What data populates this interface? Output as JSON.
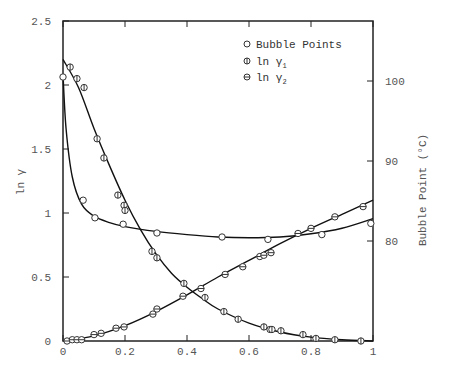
{
  "chart_data": {
    "type": "scatter",
    "title": "",
    "xlabel": "",
    "ylabel": "ln γ",
    "y2label": "Bubble Point (°C)",
    "xlim": [
      0,
      1
    ],
    "ylim": [
      0,
      2.5
    ],
    "y2lim": [
      67.5,
      107.5
    ],
    "grid": false,
    "legend_position": "upper right (inside)",
    "x_ticks": [
      "0",
      "0.2",
      "0.4",
      "0.6",
      "0.8",
      "1"
    ],
    "y_ticks": [
      "0",
      "0.5",
      "1",
      "1.5",
      "2",
      "2.5"
    ],
    "y2_ticks": [
      "80",
      "90",
      "100"
    ],
    "legend": [
      {
        "marker": "open-circle",
        "label": "Bubble Points"
      },
      {
        "marker": "circle-vertical-bar",
        "label": "ln γ₁"
      },
      {
        "marker": "circle-horizontal-bar",
        "label": "ln γ₂"
      }
    ],
    "series": [
      {
        "name": "Bubble Points",
        "axis": "right",
        "marker": "open-circle",
        "x": [
          0.0,
          0.065,
          0.103,
          0.194,
          0.303,
          0.513,
          0.661,
          0.835,
          0.993
        ],
        "y": [
          100.5,
          85.1,
          82.9,
          82.1,
          81.0,
          80.5,
          80.2,
          80.8,
          82.2
        ]
      },
      {
        "name": "ln γ₁",
        "axis": "left",
        "marker": "circle-vertical-bar",
        "x": [
          0.023,
          0.045,
          0.068,
          0.11,
          0.132,
          0.177,
          0.197,
          0.2,
          0.287,
          0.303,
          0.39,
          0.458,
          0.519,
          0.565,
          0.648,
          0.668,
          0.674,
          0.703,
          0.774,
          0.816,
          0.877,
          0.961
        ],
        "y": [
          2.14,
          2.05,
          1.98,
          1.58,
          1.43,
          1.14,
          1.06,
          1.02,
          0.7,
          0.65,
          0.45,
          0.34,
          0.23,
          0.17,
          0.11,
          0.09,
          0.09,
          0.08,
          0.05,
          0.02,
          0.01,
          0.0
        ]
      },
      {
        "name": "ln γ₂",
        "axis": "left",
        "marker": "circle-horizontal-bar",
        "x": [
          0.013,
          0.03,
          0.045,
          0.06,
          0.1,
          0.123,
          0.171,
          0.197,
          0.29,
          0.303,
          0.387,
          0.445,
          0.523,
          0.58,
          0.635,
          0.648,
          0.671,
          0.758,
          0.8,
          0.877,
          0.968
        ],
        "y": [
          0.0,
          0.01,
          0.01,
          0.01,
          0.05,
          0.06,
          0.1,
          0.11,
          0.21,
          0.25,
          0.35,
          0.41,
          0.52,
          0.58,
          0.66,
          0.67,
          0.69,
          0.84,
          0.88,
          0.97,
          1.05
        ]
      }
    ],
    "fit_curves": [
      {
        "name": "Bubble Point fit",
        "axis": "right",
        "x": [
          0,
          0.01,
          0.03,
          0.06,
          0.1,
          0.15,
          0.2,
          0.3,
          0.4,
          0.5,
          0.6,
          0.7,
          0.8,
          0.9,
          1.0
        ],
        "y": [
          100.8,
          94,
          88,
          84.6,
          83.1,
          82.3,
          81.8,
          81.2,
          80.8,
          80.5,
          80.4,
          80.5,
          80.9,
          81.6,
          82.8
        ]
      },
      {
        "name": "ln γ₁ fit",
        "axis": "left",
        "x": [
          0,
          0.05,
          0.1,
          0.15,
          0.2,
          0.25,
          0.3,
          0.35,
          0.4,
          0.45,
          0.5,
          0.6,
          0.7,
          0.8,
          0.9,
          1.0
        ],
        "y": [
          2.2,
          1.98,
          1.66,
          1.37,
          1.1,
          0.87,
          0.68,
          0.53,
          0.42,
          0.33,
          0.25,
          0.14,
          0.07,
          0.03,
          0.01,
          0.0
        ]
      },
      {
        "name": "ln γ₂ fit",
        "axis": "left",
        "x": [
          0,
          0.1,
          0.2,
          0.3,
          0.4,
          0.5,
          0.6,
          0.7,
          0.8,
          0.9,
          1.0
        ],
        "y": [
          0.0,
          0.04,
          0.12,
          0.23,
          0.36,
          0.5,
          0.63,
          0.76,
          0.88,
          0.99,
          1.1
        ]
      }
    ]
  },
  "legend": {
    "bubble_label": "Bubble Points",
    "gamma1_label": "ln γ",
    "gamma1_sub": "1",
    "gamma2_label": "ln γ",
    "gamma2_sub": "2"
  },
  "axes": {
    "ylabel": "ln γ",
    "y2label": "Bubble Point (°C)",
    "x_ticks": [
      "0",
      "0.2",
      "0.4",
      "0.6",
      "0.8",
      "1"
    ],
    "y_ticks": [
      "0",
      "0.5",
      "1",
      "1.5",
      "2",
      "2.5"
    ],
    "y2_ticks": [
      "80",
      "90",
      "100"
    ]
  }
}
